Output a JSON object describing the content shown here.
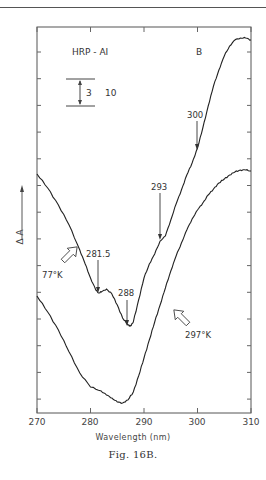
{
  "chart_data": {
    "type": "line",
    "title": "",
    "caption": "Fig. 16B.",
    "panel_label": "B",
    "sample_label": "HRP - AI",
    "xlabel": "Wavelength (nm)",
    "ylabel": "Δ A",
    "xlim": [
      270,
      310
    ],
    "x_ticks": [
      270,
      280,
      290,
      300,
      310
    ],
    "grid": false,
    "legend_position": "inline annotations",
    "scale_bar": {
      "value": "3",
      "unit_label": "10"
    },
    "series": [
      {
        "name": "77°K",
        "x": [
          270,
          272,
          274,
          276,
          278,
          279,
          280,
          281,
          281.5,
          282,
          283,
          284,
          285,
          286,
          287,
          287.5,
          288,
          289,
          290,
          291,
          292,
          293,
          294,
          295,
          296,
          297,
          298,
          299,
          300,
          301,
          302,
          303,
          304,
          305,
          306,
          307,
          308,
          309,
          310
        ],
        "y_px": [
          174,
          188,
          205,
          225,
          250,
          264,
          278,
          290,
          293,
          292,
          289,
          294,
          305,
          318,
          325,
          326,
          322,
          300,
          278,
          264,
          254,
          241,
          236,
          220,
          204,
          190,
          175,
          163,
          148,
          128,
          106,
          86,
          70,
          56,
          46,
          40,
          38,
          38,
          40
        ]
      },
      {
        "name": "297°K",
        "x": [
          270,
          272,
          274,
          276,
          278,
          280,
          282,
          283,
          284,
          285,
          286,
          287,
          288,
          289,
          290,
          291,
          292,
          293,
          294,
          295,
          296,
          297,
          298,
          299,
          300,
          301,
          302,
          303,
          304,
          305,
          306,
          307,
          308,
          309,
          310
        ],
        "y_px": [
          296,
          312,
          330,
          352,
          373,
          387,
          391,
          395,
          398,
          402,
          403,
          400,
          392,
          376,
          358,
          340,
          322,
          305,
          288,
          271,
          256,
          243,
          230,
          219,
          210,
          203,
          195,
          189,
          183,
          179,
          175,
          172,
          170,
          170,
          171
        ]
      }
    ],
    "annotations": [
      {
        "text": "281.5",
        "x": 281.5
      },
      {
        "text": "288",
        "x": 288
      },
      {
        "text": "293",
        "x": 293
      },
      {
        "text": "300",
        "x": 300
      },
      {
        "text": "77°K",
        "target": "upper curve"
      },
      {
        "text": "297°K",
        "target": "lower curve"
      }
    ]
  },
  "labels": {
    "sample": "HRP - AI",
    "panel": "B",
    "scale_value": "3",
    "scale_unit": "10",
    "ylabel": "Δ A",
    "xlabel": "Wavelength (nm)",
    "caption": "Fig. 16B.",
    "temp_low": "77°K",
    "temp_high": "297°K",
    "peak_2815": "281.5",
    "peak_288": "288",
    "peak_293": "293",
    "peak_300": "300",
    "x_ticks": [
      "270",
      "280",
      "290",
      "300",
      "310"
    ]
  }
}
